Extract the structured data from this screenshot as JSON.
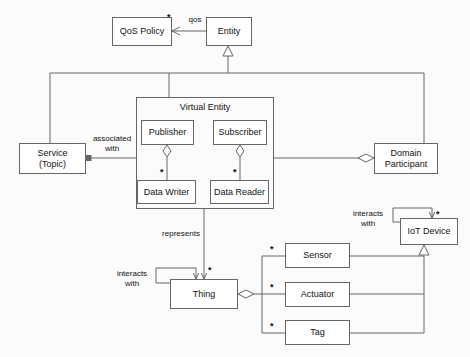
{
  "diagram": {
    "stroke_color": "#666666",
    "text_color": "#111111",
    "background_color": "#fbfbfb"
  },
  "nodes": {
    "qos_policy": {
      "label": "QoS Policy"
    },
    "entity": {
      "label": "Entity"
    },
    "virtual_entity": {
      "label": "Virtual Entity"
    },
    "publisher": {
      "label": "Publisher"
    },
    "subscriber": {
      "label": "Subscriber"
    },
    "data_writer": {
      "label": "Data Writer"
    },
    "data_reader": {
      "label": "Data Reader"
    },
    "service_topic": {
      "label_line1": "Service",
      "label_line2": "(Topic)"
    },
    "domain_participant": {
      "label_line1": "Domain",
      "label_line2": "Participant"
    },
    "thing": {
      "label": "Thing"
    },
    "sensor": {
      "label": "Sensor"
    },
    "actuator": {
      "label": "Actuator"
    },
    "tag": {
      "label": "Tag"
    },
    "iot_device": {
      "label": "IoT Device"
    }
  },
  "edge_labels": {
    "qos": "qos",
    "associated_with": "associated\nwith",
    "represents": "represents",
    "thing_interacts_with": "interacts\nwith",
    "iot_interacts_with": "interacts\nwith"
  },
  "multiplicities": {
    "qos_policy_star": "*",
    "data_writer_star": "*",
    "data_reader_star": "*",
    "thing_star": "*",
    "sensor_star": "*",
    "actuator_star": "*",
    "tag_star": "*",
    "iot_device_star": "*"
  }
}
